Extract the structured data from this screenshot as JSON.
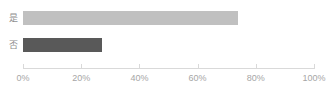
{
  "chart_data": {
    "type": "bar",
    "orientation": "horizontal",
    "title": "",
    "subtitle": "",
    "xlabel": "",
    "ylabel": "",
    "categories": [
      "是",
      "否"
    ],
    "values": [
      74,
      27
    ],
    "value_unit": "%",
    "xlim": [
      0,
      100
    ],
    "xticks": [
      0,
      20,
      40,
      60,
      80,
      100
    ],
    "xtick_labels": [
      "0%",
      "20%",
      "40%",
      "60%",
      "80%",
      "100%"
    ],
    "grid": false,
    "legend": false,
    "legend_position": "none",
    "bar_colors": [
      "#c0c0c0",
      "#595959"
    ],
    "axis_color": "#d9d9d9",
    "tick_label_color": "#a6a6a6",
    "category_label_color": "#8c8c8c",
    "background_color": "#ffffff"
  }
}
